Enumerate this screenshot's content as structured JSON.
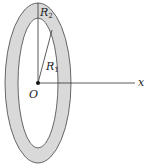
{
  "diagram": {
    "type": "annular ring (washer) in perspective with axis",
    "labels": {
      "outer_radius": "R",
      "outer_radius_sub": "2",
      "inner_radius": "R",
      "inner_radius_sub": "1",
      "origin": "O",
      "axis": "x"
    },
    "colors": {
      "ring_fill": "#d9d9d9",
      "stroke": "#333333",
      "background": "#ffffff"
    }
  }
}
